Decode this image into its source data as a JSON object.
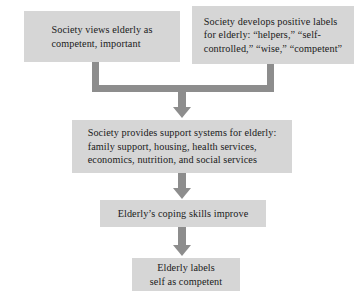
{
  "diagram": {
    "type": "flowchart",
    "direction": "top-to-bottom",
    "background_color": "#ffffff",
    "box_fill_color": "#d6d6d6",
    "connector_color": "#8d8d8d",
    "text_color": "#1a1a1a",
    "nodes": [
      {
        "id": "society-views",
        "text": "Society views elderly as\ncompetent, important"
      },
      {
        "id": "positive-labels",
        "text": "Society develops positive labels\nfor elderly: “helpers,” “self-\ncontrolled,” “wise,” “competent”"
      },
      {
        "id": "support-systems",
        "text": "Society provides support systems for elderly:\nfamily support, housing, health services,\neconomics, nutrition, and social services"
      },
      {
        "id": "coping-skills",
        "text": "Elderly’s coping skills improve"
      },
      {
        "id": "labels-self",
        "text": "Elderly labels\nself as competent"
      }
    ],
    "connectors": [
      {
        "id": "bracket-merge",
        "from": [
          "society-views",
          "positive-labels"
        ],
        "to": "support-systems",
        "style": "bracket-with-arrowhead"
      },
      {
        "id": "arrow-support-to-coping",
        "from": "support-systems",
        "to": "coping-skills",
        "style": "arrow"
      },
      {
        "id": "arrow-coping-to-labels",
        "from": "coping-skills",
        "to": "labels-self",
        "style": "arrow"
      }
    ]
  }
}
